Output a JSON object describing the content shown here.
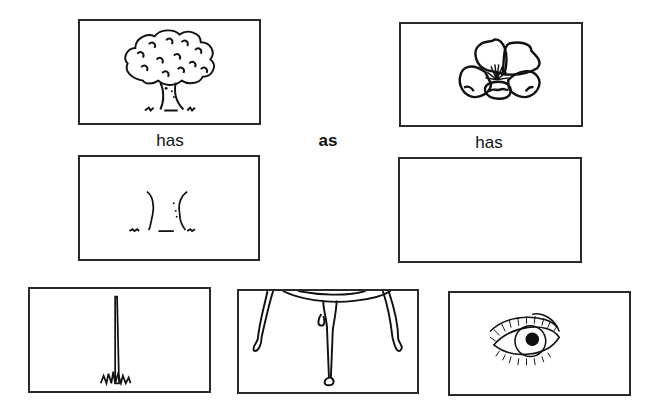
{
  "worksheet": {
    "analogy": {
      "left_label": "has",
      "connector": "as",
      "right_label": "has"
    },
    "panels": {
      "top_left": {
        "icon": "tree-icon"
      },
      "top_right": {
        "icon": "flower-icon"
      },
      "middle_left": {
        "icon": "tree-trunk-icon"
      },
      "middle_right": {
        "icon": "empty-answer-box"
      }
    },
    "choices": [
      {
        "icon": "stem-icon"
      },
      {
        "icon": "table-legs-icon"
      },
      {
        "icon": "eye-icon"
      }
    ]
  }
}
